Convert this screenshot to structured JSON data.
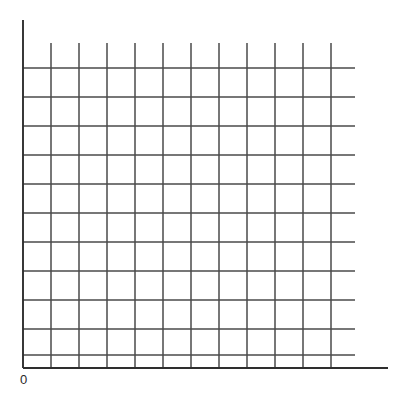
{
  "figure": {
    "background_color": "#ffffff",
    "width": 402,
    "height": 393
  },
  "labels": {
    "origin": "0"
  },
  "chart_data": {
    "type": "line",
    "title": "",
    "subtitle": "",
    "xlabel": "",
    "ylabel": "",
    "annotations": [
      "0"
    ],
    "legend": [],
    "legend_position": "none",
    "grid": true,
    "grid_color": "#4a4a4a",
    "axis_color": "#2e2e2e",
    "series": [],
    "x": [],
    "categories": [],
    "values": [],
    "xlim": [
      0,
      11
    ],
    "ylim": [
      0,
      11
    ],
    "xticks": [
      0,
      1,
      2,
      3,
      4,
      5,
      6,
      7,
      8,
      9,
      10,
      11
    ],
    "yticks": [
      0,
      1,
      2,
      3,
      4,
      5,
      6,
      7,
      8,
      9,
      10
    ],
    "xtick_labels": [
      "0",
      "",
      "",
      "",
      "",
      "",
      "",
      "",
      "",
      "",
      "",
      ""
    ],
    "ytick_labels": [
      "",
      "",
      "",
      "",
      "",
      "",
      "",
      "",
      "",
      "",
      ""
    ],
    "geometry": {
      "y_axis_x": 23,
      "y_axis_top": 20,
      "x_axis_y": 368,
      "x_axis_right": 388,
      "vertical_gridlines_x": [
        51,
        79,
        107,
        135,
        163,
        191,
        219,
        247,
        275,
        303,
        331
      ],
      "vertical_gridlines_top": 43,
      "horizontal_gridlines_y": [
        68,
        97,
        126,
        155,
        184,
        213,
        242,
        271,
        300,
        329,
        355
      ],
      "horizontal_gridlines_right": 355
    }
  }
}
